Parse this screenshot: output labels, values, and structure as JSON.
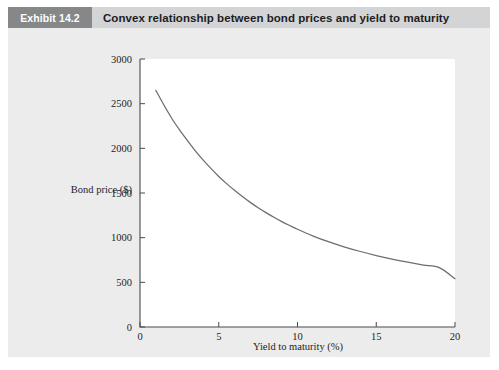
{
  "exhibit": {
    "badge_label": "Exhibit 14.2",
    "title": "Convex relationship between bond prices and yield to maturity"
  },
  "colors": {
    "panel_background": "#ececed",
    "header_band": "#d3d4d5",
    "badge_background": "#858789",
    "badge_text": "#ffffff",
    "plot_background": "#ffffff",
    "axis": "#4a4a4a",
    "curve": "#6d6d6d",
    "text": "#1d1d1f"
  },
  "chart_data": {
    "type": "line",
    "title": "Convex relationship between bond prices and yield to maturity",
    "xlabel": "Yield to maturity (%)",
    "ylabel": "Bond price ($)",
    "xlim": [
      0,
      20
    ],
    "ylim": [
      0,
      3000
    ],
    "xticks": [
      0,
      5,
      10,
      15,
      20
    ],
    "yticks": [
      0,
      500,
      1000,
      1500,
      2000,
      2500,
      3000
    ],
    "xtick_labels": [
      "0",
      "5",
      "10",
      "15",
      "20"
    ],
    "ytick_labels": [
      "0",
      "500",
      "1000",
      "1500",
      "2000",
      "2500",
      "3000"
    ],
    "grid": false,
    "legend": "none",
    "series": [
      {
        "name": "Bond price",
        "x": [
          1,
          1.5,
          2,
          2.5,
          3,
          3.5,
          4,
          4.5,
          5,
          5.5,
          6,
          6.5,
          7,
          7.5,
          8,
          8.5,
          9,
          9.5,
          10,
          11,
          12,
          13,
          14,
          15,
          16,
          17,
          18,
          19,
          20
        ],
        "y": [
          2650,
          2490,
          2340,
          2210,
          2090,
          1975,
          1870,
          1775,
          1685,
          1605,
          1530,
          1460,
          1395,
          1335,
          1280,
          1228,
          1180,
          1136,
          1094,
          1018,
          952,
          895,
          845,
          800,
          760,
          725,
          693,
          664,
          540
        ]
      }
    ]
  }
}
